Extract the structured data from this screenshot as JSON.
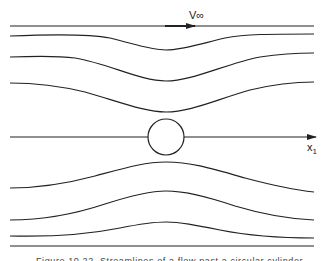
{
  "figure": {
    "freestream_label": "V∞",
    "axis_label": "x",
    "axis_subscript": "1",
    "caption": "Figure 10.22. Streamlines of a flow past a circular cylinder"
  },
  "geometry": {
    "cylinder": {
      "cx": 166,
      "cy": 137,
      "r": 18
    },
    "streamline_color": "#222222",
    "background": "#ffffff"
  }
}
